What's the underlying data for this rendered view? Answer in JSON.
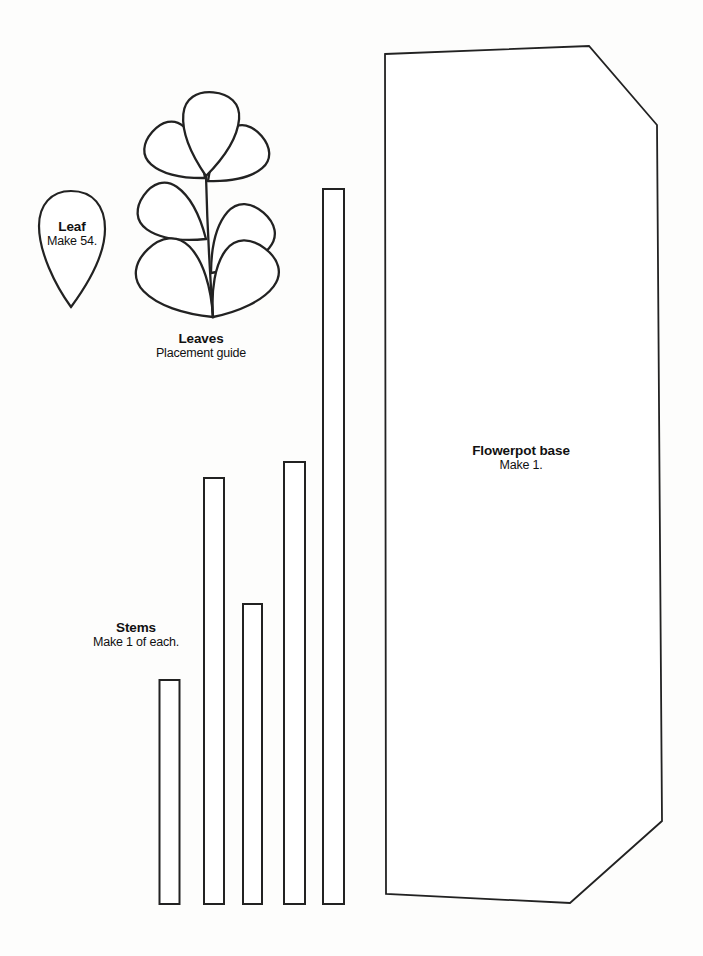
{
  "page": {
    "type": "craft-pattern-sheet",
    "background_color": "#fdfdfc",
    "outline_color": "#222222",
    "text_color": "#111111"
  },
  "pieces": {
    "leaf": {
      "title": "Leaf",
      "subtitle": "Make 54."
    },
    "leaves_guide": {
      "title": "Leaves",
      "subtitle": "Placement guide"
    },
    "stems": {
      "title": "Stems",
      "subtitle": "Make 1 of each."
    },
    "flowerpot": {
      "title": "Flowerpot base",
      "subtitle": "Make 1."
    }
  },
  "shape_counts": {
    "stems": 5,
    "leaves_in_guide": 7
  }
}
